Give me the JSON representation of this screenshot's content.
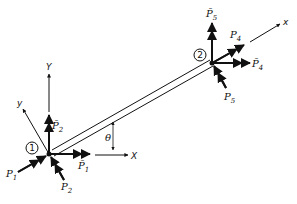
{
  "figure": {
    "nodes": [
      {
        "id": "node-1",
        "label": "1",
        "x": 49,
        "y": 154
      },
      {
        "id": "node-2",
        "label": "2",
        "x": 212,
        "y": 63
      }
    ],
    "global_axes": {
      "x_label": "X",
      "y_label": "Y"
    },
    "local_axes": {
      "x_label": "x",
      "y_label": "y"
    },
    "angle_label": "θ",
    "forces": {
      "node1_local": [
        {
          "symbol": "P",
          "sub": "1"
        },
        {
          "symbol": "P",
          "sub": "2"
        }
      ],
      "node1_global": [
        {
          "symbol": "P̄",
          "sub": "1"
        },
        {
          "symbol": "P̄",
          "sub": "2"
        }
      ],
      "node2_local": [
        {
          "symbol": "P",
          "sub": "4"
        },
        {
          "symbol": "P",
          "sub": "5"
        }
      ],
      "node2_global": [
        {
          "symbol": "P̄",
          "sub": "4"
        },
        {
          "symbol": "P̄",
          "sub": "5"
        }
      ]
    }
  }
}
